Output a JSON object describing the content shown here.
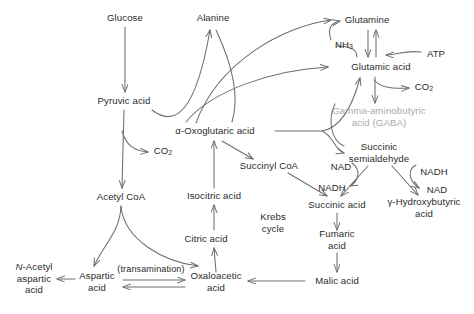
{
  "diagram": {
    "type": "metabolic-pathway",
    "width": 474,
    "height": 314,
    "colors": {
      "text": "#2b2b2b",
      "muted_text": "#a9a9a9",
      "stroke": "#6e6e6e",
      "background": "#ffffff"
    },
    "nodes": [
      {
        "id": "glucose",
        "label": "Glucose",
        "x": 125,
        "y": 18,
        "muted": false
      },
      {
        "id": "alanine",
        "label": "Alanine",
        "x": 213,
        "y": 18,
        "muted": false
      },
      {
        "id": "glutamine",
        "label": "Glutamine",
        "x": 367,
        "y": 20,
        "muted": false
      },
      {
        "id": "ammonia",
        "label": "NH3",
        "x": 344,
        "y": 46,
        "muted": false
      },
      {
        "id": "atp",
        "label": "ATP",
        "x": 436,
        "y": 54,
        "muted": false
      },
      {
        "id": "glutamic-acid",
        "label": "Glutamic acid",
        "x": 381,
        "y": 67,
        "muted": false
      },
      {
        "id": "pyruvic-acid",
        "label": "Pyruvic acid",
        "x": 124,
        "y": 101,
        "muted": false
      },
      {
        "id": "co2-glutamic",
        "label": "CO2",
        "x": 424,
        "y": 88,
        "muted": false
      },
      {
        "id": "gaba",
        "label": "Gamma-aminobutyric\nacid (GABA)",
        "x": 379,
        "y": 116,
        "muted": true
      },
      {
        "id": "oxoglutaric-acid",
        "label": "α-Oxoglutaric acid",
        "x": 215,
        "y": 131,
        "muted": false
      },
      {
        "id": "co2-pyruvate",
        "label": "CO2",
        "x": 163,
        "y": 152,
        "muted": false
      },
      {
        "id": "succinic-semi",
        "label": "Succinic\nsemialdehyde",
        "x": 379,
        "y": 152,
        "muted": false
      },
      {
        "id": "succinyl-coa",
        "label": "Succinyl CoA",
        "x": 269,
        "y": 166,
        "muted": false
      },
      {
        "id": "nad-left",
        "label": "NAD",
        "x": 341,
        "y": 167,
        "muted": false
      },
      {
        "id": "nadh-right",
        "label": "NADH",
        "x": 434,
        "y": 172,
        "muted": false
      },
      {
        "id": "nadh-left",
        "label": "NADH",
        "x": 332,
        "y": 188,
        "muted": false
      },
      {
        "id": "nad-right",
        "label": "NAD",
        "x": 437,
        "y": 190,
        "muted": false
      },
      {
        "id": "isocitric-acid",
        "label": "Isocitric acid",
        "x": 214,
        "y": 196,
        "muted": false
      },
      {
        "id": "acetyl-coa",
        "label": "Acetyl CoA",
        "x": 121,
        "y": 197,
        "muted": false
      },
      {
        "id": "succinic-acid",
        "label": "Succinic acid",
        "x": 337,
        "y": 205,
        "muted": false
      },
      {
        "id": "hydroxybutyric",
        "label": "γ-Hydroxybutyric\nacid",
        "x": 424,
        "y": 207,
        "muted": false
      },
      {
        "id": "krebs-cycle",
        "label": "Krebs\ncycle",
        "x": 273,
        "y": 222,
        "muted": false
      },
      {
        "id": "citric-acid",
        "label": "Citric acid",
        "x": 206,
        "y": 239,
        "muted": false
      },
      {
        "id": "fumaric-acid",
        "label": "Fumaric\nacid",
        "x": 337,
        "y": 239,
        "muted": false
      },
      {
        "id": "n-acetyl-aspartic",
        "label": "N-Acetyl\naspartic\nacid",
        "x": 34,
        "y": 278,
        "muted": false,
        "italic_first": true
      },
      {
        "id": "transamination",
        "label": "(transamination)",
        "x": 151,
        "y": 270,
        "muted": false,
        "small": true
      },
      {
        "id": "aspartic-acid",
        "label": "Aspartic\nacid",
        "x": 97,
        "y": 281,
        "muted": false
      },
      {
        "id": "oxaloacetic-acid",
        "label": "Oxaloacetic\nacid",
        "x": 216,
        "y": 281,
        "muted": false
      },
      {
        "id": "malic-acid",
        "label": "Malic acid",
        "x": 337,
        "y": 281,
        "muted": false
      }
    ],
    "edges": [
      {
        "from": "glucose",
        "to": "pyruvic-acid",
        "label": ""
      },
      {
        "from": "pyruvic-acid",
        "to": "alanine",
        "label": ""
      },
      {
        "from": "pyruvic-acid",
        "to": "acetyl-coa",
        "label": ""
      },
      {
        "from": "pyruvic-acid",
        "to": "co2-pyruvate",
        "label": ""
      },
      {
        "from": "oxoglutaric-acid",
        "to": "alanine",
        "label": ""
      },
      {
        "from": "oxoglutaric-acid",
        "to": "glutamine",
        "label": ""
      },
      {
        "from": "oxoglutaric-acid",
        "to": "glutamic-acid",
        "label": ""
      },
      {
        "from": "oxoglutaric-acid",
        "to": "succinic-semi",
        "label": ""
      },
      {
        "from": "oxoglutaric-acid",
        "to": "succinyl-coa",
        "label": ""
      },
      {
        "from": "glutamic-acid",
        "to": "glutamine",
        "label": ""
      },
      {
        "from": "glutamine",
        "to": "glutamic-acid",
        "label": ""
      },
      {
        "from": "glutamic-acid",
        "to": "ammonia",
        "label": ""
      },
      {
        "from": "ammonia",
        "to": "glutamine",
        "label": ""
      },
      {
        "from": "atp",
        "to": "glutamine",
        "label": ""
      },
      {
        "from": "glutamic-acid",
        "to": "gaba",
        "label": ""
      },
      {
        "from": "glutamic-acid",
        "to": "co2-glutamic",
        "label": ""
      },
      {
        "from": "gaba",
        "to": "succinic-semi",
        "label": ""
      },
      {
        "from": "succinic-semi",
        "to": "succinic-acid",
        "label": "NAD / NADH"
      },
      {
        "from": "succinic-semi",
        "to": "hydroxybutyric",
        "label": "NADH / NAD"
      },
      {
        "from": "succinyl-coa",
        "to": "succinic-acid",
        "label": ""
      },
      {
        "from": "succinic-acid",
        "to": "fumaric-acid",
        "label": ""
      },
      {
        "from": "fumaric-acid",
        "to": "malic-acid",
        "label": ""
      },
      {
        "from": "malic-acid",
        "to": "oxaloacetic-acid",
        "label": ""
      },
      {
        "from": "oxaloacetic-acid",
        "to": "aspartic-acid",
        "label": "(transamination)"
      },
      {
        "from": "aspartic-acid",
        "to": "oxaloacetic-acid",
        "label": "(transamination)"
      },
      {
        "from": "aspartic-acid",
        "to": "n-acetyl-aspartic",
        "label": ""
      },
      {
        "from": "acetyl-coa",
        "to": "aspartic-acid",
        "label": ""
      },
      {
        "from": "acetyl-coa",
        "to": "citric-acid",
        "label": ""
      },
      {
        "from": "oxaloacetic-acid",
        "to": "citric-acid",
        "label": ""
      },
      {
        "from": "citric-acid",
        "to": "isocitric-acid",
        "label": ""
      },
      {
        "from": "isocitric-acid",
        "to": "oxoglutaric-acid",
        "label": ""
      }
    ]
  }
}
